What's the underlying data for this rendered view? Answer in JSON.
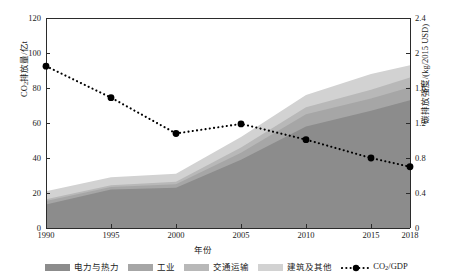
{
  "chart_data": {
    "type": "area",
    "title": "",
    "xlabel": "年份",
    "ylabel": "CO2排放量/亿t",
    "ylabel_right": "碳排放强度/(kg/2015 USD)",
    "x": [
      1990,
      1995,
      2000,
      2005,
      2010,
      2015,
      2018
    ],
    "categories": [
      "1990",
      "1995",
      "2000",
      "2005",
      "2010",
      "2015",
      "2018"
    ],
    "ylim": [
      0,
      120
    ],
    "yticks": [
      0,
      20,
      40,
      60,
      80,
      100,
      120
    ],
    "ylim_right": [
      0,
      2.4
    ],
    "yticks_right": [
      "0",
      "0.4",
      "0.8",
      "1.2",
      "1.6",
      "2",
      "2.4"
    ],
    "grid": false,
    "legend_position": "bottom",
    "stacked": true,
    "series": [
      {
        "name": "电力与热力",
        "axis": "left",
        "color": "#8c8c8c",
        "values": [
          13.5,
          22.0,
          23.0,
          39.0,
          58.0,
          67.0,
          73.0
        ]
      },
      {
        "name": "工业",
        "axis": "left",
        "color": "#a6a6a6",
        "values": [
          2.0,
          1.5,
          2.0,
          4.0,
          7.0,
          7.0,
          7.5
        ]
      },
      {
        "name": "交通运输",
        "axis": "left",
        "color": "#b8b8b8",
        "values": [
          1.0,
          1.0,
          1.5,
          3.0,
          4.0,
          5.0,
          5.5
        ]
      },
      {
        "name": "建筑及其他",
        "axis": "left",
        "color": "#d2d2d2",
        "values": [
          4.5,
          4.5,
          4.5,
          6.0,
          7.0,
          9.0,
          7.0
        ]
      },
      {
        "name": "CO2/GDP",
        "axis": "right",
        "color": "#000000",
        "type": "line",
        "values": [
          1.85,
          1.49,
          1.08,
          1.19,
          1.01,
          0.8,
          0.7
        ]
      }
    ],
    "stack_totals": [
      21.0,
      29.0,
      31.0,
      52.0,
      76.0,
      88.0,
      93.0
    ]
  },
  "axes": {
    "y_left_ticks": [
      "0",
      "20",
      "40",
      "60",
      "80",
      "100",
      "120"
    ],
    "y_right_ticks": [
      "0",
      "0.4",
      "0.8",
      "1.2",
      "1.6",
      "2",
      "2.4"
    ],
    "x_ticks": [
      "1990",
      "1995",
      "2000",
      "2005",
      "2010",
      "2015",
      "2018"
    ],
    "y_left_title_main": "CO",
    "y_left_title_sub": "2",
    "y_left_title_rest": "排放量/亿t",
    "y_right_title": "碳排放强度/(kg/2015 USD)",
    "x_title": "年份"
  },
  "legend": {
    "items": [
      {
        "label": "电力与热力",
        "color": "#8c8c8c",
        "kind": "swatch",
        "name": "electricity-heat"
      },
      {
        "label": "工业",
        "color": "#a6a6a6",
        "kind": "swatch",
        "name": "industry"
      },
      {
        "label": "交通运输",
        "color": "#b8b8b8",
        "kind": "swatch",
        "name": "transport"
      },
      {
        "label": "建筑及其他",
        "color": "#d2d2d2",
        "kind": "swatch",
        "name": "buildings-other"
      }
    ],
    "line_item": {
      "label_main": "CO",
      "label_sub": "2",
      "label_rest": "/GDP",
      "color": "#000000",
      "kind": "dotted-line-marker",
      "name": "co2-gdp"
    }
  },
  "colors": {
    "axis": "#2b2b2b",
    "background": "#ffffff",
    "text": "#1a1a1a"
  }
}
